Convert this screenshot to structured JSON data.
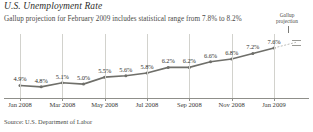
{
  "header": {
    "title": "U.S. Unemployment Rate",
    "subtitle": "Gallup projection for February 2009 includes statistical range from 7.8% to 8.2%"
  },
  "annotation": {
    "line1": "Gallup",
    "line2": "projection",
    "pointer_icon": "vertical-line-pointer"
  },
  "source": {
    "text": "Source: U.S. Department of Labor"
  },
  "colors": {
    "line": "#6f6f6a",
    "grid": "#d2d2cd",
    "axis": "#8f8f8a",
    "text": "#2e2e2c",
    "background": "#ffffff"
  },
  "chart_data": {
    "type": "line",
    "title": "U.S. Unemployment Rate",
    "subtitle": "Gallup projection for February 2009 includes statistical range from 7.8% to 8.2%",
    "xlabel": "",
    "ylabel": "",
    "ylim": [
      4.0,
      8.6
    ],
    "grid": true,
    "legend": false,
    "categories": [
      "Jan 2008",
      "Feb 2008",
      "Mar 2008",
      "Apr 2008",
      "May 2008",
      "Jun 2008",
      "Jul 2008",
      "Aug 2008",
      "Sep 2008",
      "Oct 2008",
      "Nov 2008",
      "Dec 2008",
      "Jan 2009"
    ],
    "values": [
      4.9,
      4.8,
      5.1,
      5.0,
      5.5,
      5.6,
      5.8,
      6.2,
      6.2,
      6.6,
      6.8,
      7.2,
      7.6
    ],
    "point_labels": [
      "4.9%",
      "4.8%",
      "5.1%",
      "5.0%",
      "5.5%",
      "5.6%",
      "5.8%",
      "6.2%",
      "6.2%",
      "6.6%",
      "6.8%",
      "7.2%",
      "7.6%"
    ],
    "tick_labels": [
      "Jan 2008",
      "Mar 2008",
      "May 2008",
      "Jul 2008",
      "Sep 2008",
      "Nov 2008",
      "Jan 2009"
    ],
    "tick_indices": [
      0,
      2,
      4,
      6,
      8,
      10,
      12
    ],
    "projection": {
      "label": "Gallup projection",
      "period": "February 2009",
      "range_low": 7.8,
      "range_high": 8.2,
      "range_low_label": "7.8%",
      "range_high_label": "8.2%"
    }
  }
}
